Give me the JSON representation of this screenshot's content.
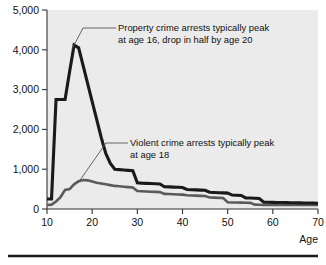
{
  "chart_data": {
    "type": "line",
    "title": "",
    "xlabel": "Age",
    "ylabel": "",
    "xlim": [
      10,
      70
    ],
    "ylim": [
      0,
      5000
    ],
    "grid": false,
    "legend": "none",
    "plot_background": "#ebebeb",
    "x_ticks": [
      "10",
      "20",
      "30",
      "40",
      "50",
      "60",
      "70"
    ],
    "x_tick_values": [
      10,
      20,
      30,
      40,
      50,
      60,
      70
    ],
    "y_ticks": [
      "0",
      "1,000",
      "2,000",
      "3,000",
      "4,000",
      "5,000"
    ],
    "y_tick_values": [
      0,
      1000,
      2000,
      3000,
      4000,
      5000
    ],
    "x": [
      10,
      11,
      12,
      13,
      14,
      15,
      16,
      17,
      18,
      19,
      20,
      21,
      22,
      23,
      24,
      25,
      26,
      27,
      28,
      29,
      30,
      31,
      32,
      33,
      34,
      35,
      36,
      37,
      38,
      39,
      40,
      41,
      42,
      43,
      44,
      45,
      46,
      47,
      48,
      49,
      50,
      51,
      52,
      53,
      54,
      55,
      56,
      57,
      58,
      59,
      60,
      61,
      62,
      63,
      64,
      65,
      66,
      67,
      68,
      69,
      70
    ],
    "series": [
      {
        "name": "Property crime arrests",
        "color": "#1a1a1a",
        "width": 3.1,
        "values": [
          250,
          250,
          2750,
          2750,
          2750,
          3450,
          4120,
          4050,
          3600,
          3150,
          2700,
          2250,
          1800,
          1400,
          1150,
          1000,
          990,
          980,
          970,
          960,
          660,
          650,
          645,
          640,
          635,
          630,
          560,
          555,
          550,
          545,
          540,
          490,
          485,
          480,
          475,
          470,
          420,
          415,
          410,
          405,
          400,
          350,
          345,
          340,
          280,
          275,
          270,
          265,
          170,
          168,
          166,
          164,
          162,
          160,
          158,
          156,
          154,
          152,
          150,
          148,
          146
        ]
      },
      {
        "name": "Violent crime arrests",
        "color": "#5a5a5a",
        "width": 2.6,
        "values": [
          100,
          110,
          190,
          300,
          480,
          500,
          620,
          700,
          730,
          720,
          690,
          660,
          640,
          620,
          600,
          580,
          570,
          560,
          550,
          540,
          450,
          445,
          440,
          435,
          430,
          425,
          380,
          375,
          370,
          365,
          360,
          345,
          340,
          335,
          330,
          325,
          290,
          285,
          280,
          275,
          170,
          165,
          162,
          160,
          158,
          155,
          110,
          105,
          100,
          100,
          100,
          100,
          100,
          100,
          100,
          100,
          100,
          100,
          100,
          100,
          100
        ]
      }
    ],
    "annotations": [
      {
        "id": "property-annotation",
        "line1": "Property crime arrests typically peak",
        "line2": "at age 16, drop in half by age 20",
        "points_to_age": 16,
        "points_to_value": 4120
      },
      {
        "id": "violent-annotation",
        "line1": "Violent crime arrests typically peak",
        "line2": "at age 18",
        "points_to_age": 18,
        "points_to_value": 730
      }
    ]
  }
}
